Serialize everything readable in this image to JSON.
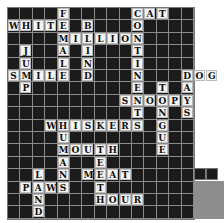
{
  "puzzle": {
    "type": "crossword",
    "rows": 17,
    "cols": 15,
    "cell_size": 12.4,
    "colors": {
      "block": "#1b1b1b",
      "letter_bg": "#f4f4f4",
      "grid_line": "#8a8a8a",
      "outside": "#8e8e8e"
    },
    "words": [
      {
        "word": "CAT",
        "row": 0,
        "col": 10,
        "dir": "across"
      },
      {
        "word": "WHITE",
        "row": 1,
        "col": 0,
        "dir": "across"
      },
      {
        "word": "MILLION",
        "row": 2,
        "col": 4,
        "dir": "across"
      },
      {
        "word": "SMILE",
        "row": 5,
        "col": 0,
        "dir": "across"
      },
      {
        "word": "DOG",
        "row": 5,
        "col": 14,
        "dir": "across"
      },
      {
        "word": "SNOOPY",
        "row": 7,
        "col": 9,
        "dir": "across"
      },
      {
        "word": "WHISKERS",
        "row": 9,
        "col": 3,
        "dir": "across"
      },
      {
        "word": "MOUTH",
        "row": 11,
        "col": 4,
        "dir": "across"
      },
      {
        "word": "MEAT",
        "row": 13,
        "col": 6,
        "dir": "across"
      },
      {
        "word": "PAWS",
        "row": 14,
        "col": 1,
        "dir": "across"
      },
      {
        "word": "HOUR",
        "row": 15,
        "col": 7,
        "dir": "across"
      },
      {
        "word": "FEMALE",
        "row": 0,
        "col": 4,
        "dir": "down"
      },
      {
        "word": "CONTINENTS",
        "row": 0,
        "col": 10,
        "dir": "down"
      },
      {
        "word": "BLIND",
        "row": 1,
        "col": 6,
        "dir": "down"
      },
      {
        "word": "JUMP",
        "row": 3,
        "col": 1,
        "dir": "down"
      },
      {
        "word": "DAYS",
        "row": 5,
        "col": 14,
        "dir": "down"
      },
      {
        "word": "TONGUE",
        "row": 6,
        "col": 12,
        "dir": "down"
      },
      {
        "word": "HUMANS",
        "row": 9,
        "col": 4,
        "dir": "down"
      },
      {
        "word": "TEETH",
        "row": 11,
        "col": 7,
        "dir": "down"
      },
      {
        "word": "LAND",
        "row": 13,
        "col": 2,
        "dir": "down"
      }
    ]
  }
}
